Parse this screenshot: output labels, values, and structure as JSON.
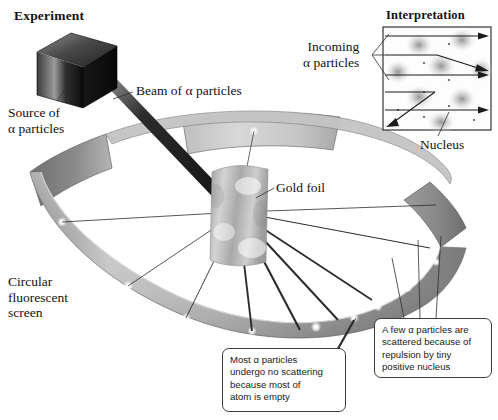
{
  "figure": {
    "panels": {
      "experiment_title": "Experiment",
      "interpretation_title": "Interpretation"
    },
    "labels": {
      "source": "Source of\nα particles",
      "beam": "Beam of α particles",
      "gold_foil": "Gold foil",
      "screen": "Circular\nfluorescent\nscreen",
      "incoming": "Incoming\nα particles",
      "nucleus": "Nucleus"
    },
    "callouts": {
      "few": "A few α particles are\nscattered because of\nrepulsion by tiny\npositive nucleus",
      "most": "Most α particles\nundergo no scattering\nbecause most of\natom is empty"
    },
    "colors": {
      "ink": "#111111",
      "ring_light": "#d6d6d6",
      "ring_mid": "#9e9e9e",
      "ring_dark": "#7c7c7c",
      "source_box": "#141414",
      "foil": "#b9b9b9",
      "panel_border": "#3a3a3a",
      "flash": "#ffffff"
    },
    "interpretation_panel": {
      "rays": [
        {
          "id": "ray-1",
          "type": "straight",
          "y": 36
        },
        {
          "id": "ray-2",
          "type": "deflected",
          "y": 55,
          "deflect_to_y": 70
        },
        {
          "id": "ray-3",
          "type": "straight",
          "y": 75
        },
        {
          "id": "ray-4",
          "type": "backscattered",
          "y": 92,
          "deflect_to_y": 124
        },
        {
          "id": "ray-5",
          "type": "straight",
          "y": 110
        }
      ],
      "nuclei_count": 8
    },
    "screen_flashes": 9,
    "scatter_rays": 9
  }
}
